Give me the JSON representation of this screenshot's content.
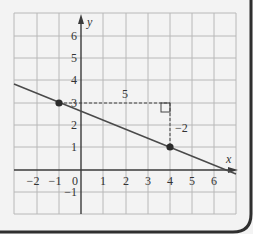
{
  "diagram": {
    "type": "coordinate-plane-line",
    "x_axis_label": "x",
    "y_axis_label": "y",
    "x_ticks": [
      "-2",
      "-1",
      "0",
      "1",
      "2",
      "3",
      "4",
      "5",
      "6"
    ],
    "y_ticks": [
      "-1",
      "1",
      "2",
      "3",
      "4",
      "5",
      "6"
    ],
    "points": [
      {
        "x": -1,
        "y": 3
      },
      {
        "x": 4,
        "y": 1
      }
    ],
    "run_label": "5",
    "rise_label": "-2",
    "line": {
      "slope": -0.4,
      "intercept": 2.6
    },
    "colors": {
      "grid": "#b8b8b8",
      "axis": "#3a3a3a",
      "line": "#4a4a4a",
      "point": "#2a2a2a",
      "background": "#f3f3f3",
      "border": "#2f2f2f"
    }
  }
}
